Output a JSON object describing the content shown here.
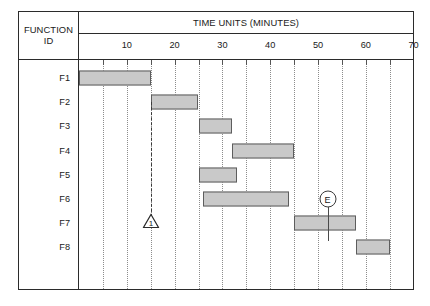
{
  "header": {
    "row_header_label": "FUNCTION\nID",
    "row_header_line1": "FUNCTION",
    "row_header_line2": "ID",
    "time_axis_title": "TIME UNITS (MINUTES)"
  },
  "colors": {
    "bar_fill": "#c9c9c9",
    "bar_stroke": "#5d5d5d",
    "frame": "#2b2b2b",
    "gridline": "#8c8c8c",
    "text": "#1a1a1a"
  },
  "chart_data": {
    "type": "bar",
    "title": "TIME UNITS (MINUTES)",
    "xlabel": "TIME UNITS (MINUTES)",
    "ylabel": "FUNCTION ID",
    "orientation": "horizontal",
    "xlim": [
      0,
      70
    ],
    "tick_interval": 10,
    "gridline_interval": 5,
    "tick_labels": [
      10,
      20,
      30,
      40,
      50,
      60,
      70
    ],
    "gridlines": [
      5,
      10,
      15,
      20,
      25,
      30,
      35,
      40,
      45,
      50,
      55,
      60,
      65,
      70
    ],
    "grid": true,
    "legend": "none",
    "categories": [
      "F1",
      "F2",
      "F3",
      "F4",
      "F5",
      "F6",
      "F7",
      "F8"
    ],
    "tasks": [
      {
        "id": "F1",
        "start": 0,
        "end": 15,
        "duration": 15
      },
      {
        "id": "F2",
        "start": 15,
        "end": 25,
        "duration": 10
      },
      {
        "id": "F3",
        "start": 25,
        "end": 32,
        "duration": 7
      },
      {
        "id": "F4",
        "start": 32,
        "end": 45,
        "duration": 13
      },
      {
        "id": "F5",
        "start": 25,
        "end": 33,
        "duration": 8
      },
      {
        "id": "F6",
        "start": 26,
        "end": 44,
        "duration": 18
      },
      {
        "id": "F7",
        "start": 45,
        "end": 58,
        "duration": 13
      },
      {
        "id": "F8",
        "start": 58,
        "end": 65,
        "duration": 7
      }
    ],
    "annotations": [
      {
        "name": "milestone-1",
        "shape": "triangle",
        "label": "1",
        "x": 15,
        "row": "F7"
      },
      {
        "name": "event-e",
        "shape": "circle",
        "label": "E",
        "x": 52,
        "row": "F6"
      }
    ]
  }
}
